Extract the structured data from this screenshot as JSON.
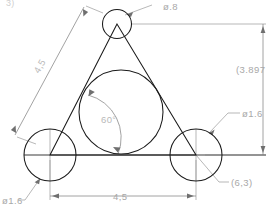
{
  "drawing": {
    "type": "cad-technical-drawing",
    "title": "Equilateral triangle with inscribed and vertex circles",
    "units_note": "decimal comma notation",
    "background_color": "#ffffff",
    "geometry_color": "#1a1a1a",
    "dimension_color": "#a8a8a8",
    "baseline_color": "#7d7d7d"
  },
  "labels": {
    "top_circle_diameter": "ø.8",
    "right_circle_diameter": "ø1.6",
    "left_circle_diameter": "ø1.6",
    "vertical_reference": "(3.897",
    "coordinate_callout": "(6,3)",
    "left_side_length": "4,5",
    "bottom_length": "4,5",
    "interior_angle": "60°",
    "corner_clipped": "3)"
  },
  "geometry_data": {
    "triangle": {
      "shape": "equilateral",
      "side_length": 4.5,
      "interior_angle_deg": 60,
      "height": 3.897,
      "vertices": [
        {
          "name": "apex",
          "x": 117,
          "y": 24
        },
        {
          "name": "bottom-left",
          "x": 50,
          "y": 155
        },
        {
          "name": "bottom-right",
          "x": 196,
          "y": 155
        }
      ]
    },
    "circles": [
      {
        "name": "apex-circle",
        "cx": 117,
        "cy": 24,
        "r": 14.5,
        "diameter": 0.8
      },
      {
        "name": "bottom-left-circle",
        "cx": 50,
        "cy": 155,
        "r": 26,
        "diameter": 1.6
      },
      {
        "name": "bottom-right-circle",
        "cx": 196,
        "cy": 155,
        "r": 26,
        "diameter": 1.6
      },
      {
        "name": "inscribed-circle",
        "cx": 121,
        "cy": 112,
        "r": 42,
        "diameter": 2.598
      }
    ]
  }
}
